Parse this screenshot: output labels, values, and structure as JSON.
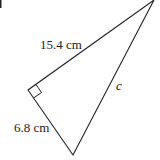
{
  "diagram": {
    "type": "right-triangle",
    "vertices": {
      "top": [
        154,
        0
      ],
      "right_angle": [
        28,
        90
      ],
      "bottom": [
        73,
        155
      ]
    },
    "sides": [
      {
        "name": "upper-leg",
        "label": "15.4 cm",
        "pos": [
          40,
          49
        ]
      },
      {
        "name": "lower-leg",
        "label": "6.8 cm",
        "pos": [
          14,
          132
        ]
      },
      {
        "name": "hypotenuse",
        "label": "c",
        "pos": [
          116,
          90
        ]
      }
    ],
    "colors": {
      "stroke": "#222222",
      "background": "#ffffff"
    }
  }
}
